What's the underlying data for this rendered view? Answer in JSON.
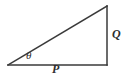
{
  "figure": {
    "type": "right-triangle-diagram",
    "background_color": "#ffffff",
    "stroke_color": "#3a3a3a",
    "label_color": "#2f2f2f",
    "stroke_width": 1.5,
    "geometry": {
      "left_vertex": [
        8,
        65
      ],
      "bottom_right_vertex": [
        107,
        65
      ],
      "top_right_vertex": [
        107,
        6
      ],
      "base_length_px": 99,
      "vertical_leg_length_px": 59,
      "right_angle_at": "bottom-right",
      "right_angle_marked": false,
      "angle_arc_drawn": false
    },
    "labels": {
      "angle": "θ",
      "base": "P",
      "vertical": "Q"
    }
  }
}
